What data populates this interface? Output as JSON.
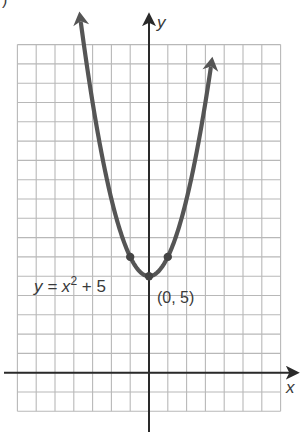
{
  "figure": {
    "corner_label": ")",
    "axis_labels": {
      "x": "x",
      "y": "y"
    },
    "equation_label": {
      "lhs": "y = x",
      "exponent": "2",
      "rhs": " + 5"
    },
    "point_label": "(0, 5)"
  },
  "chart_data": {
    "type": "line",
    "title": "",
    "function": "y = x^2 + 5",
    "xlabel": "x",
    "ylabel": "y",
    "xlim": [
      -7,
      7
    ],
    "ylim": [
      -2,
      17
    ],
    "grid": true,
    "grid_step": 1,
    "tick_labels": "none",
    "series": [
      {
        "name": "y = x^2 + 5",
        "x": [
          -3.5,
          -3,
          -2,
          -1,
          0,
          1,
          2,
          3,
          3.3
        ],
        "y": [
          17.25,
          14,
          9,
          6,
          5,
          6,
          9,
          14,
          15.89
        ],
        "arrows_at_ends": true,
        "color": "#555555"
      }
    ],
    "highlighted_points": [
      {
        "x": -1,
        "y": 6
      },
      {
        "x": 0,
        "y": 5,
        "label": "(0, 5)"
      },
      {
        "x": 1,
        "y": 6
      }
    ],
    "annotations": [
      {
        "text": "y = x^2 + 5",
        "position": "left of vertex"
      },
      {
        "text": "(0, 5)",
        "position": "below-right of vertex"
      }
    ]
  }
}
